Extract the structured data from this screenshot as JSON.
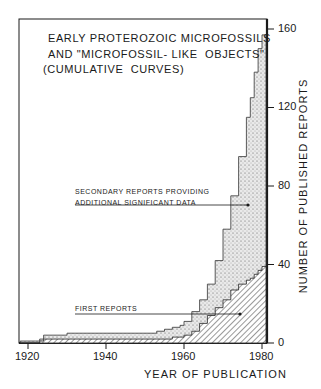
{
  "chart_data": {
    "type": "area",
    "title_lines": [
      "EARLY PROTEROZOIC MICROFOSSILS",
      "AND \"MICROFOSSIL- LIKE  OBJECTS\"",
      "(CUMULATIVE  CURVES)"
    ],
    "xlabel": "YEAR OF PUBLICATION",
    "ylabel": "NUMBER OF PUBLISHED REPORTS",
    "xlim": [
      1918,
      1981
    ],
    "ylim": [
      0,
      165
    ],
    "x_ticks": [
      1920,
      1940,
      1960,
      1980
    ],
    "y_ticks": [
      0,
      40,
      80,
      120,
      160
    ],
    "grid": false,
    "y_axis_position": "right",
    "x": [
      1918,
      1922,
      1923,
      1924,
      1930,
      1940,
      1950,
      1953,
      1955,
      1957,
      1959,
      1960,
      1962,
      1964,
      1966,
      1968,
      1970,
      1972,
      1974,
      1976,
      1977,
      1978,
      1979,
      1980
    ],
    "series": [
      {
        "name": "Secondary reports providing additional significant data (total cumulative)",
        "fill": "stippled",
        "values": [
          1,
          1,
          2,
          4,
          5,
          5,
          5,
          6,
          7,
          8,
          9,
          11,
          16,
          22,
          30,
          42,
          58,
          75,
          95,
          115,
          125,
          138,
          150,
          157
        ]
      },
      {
        "name": "First reports",
        "fill": "hatched",
        "values": [
          0,
          0,
          1,
          2,
          2,
          2,
          2,
          2,
          2,
          3,
          3,
          4,
          6,
          10,
          14,
          18,
          22,
          27,
          30,
          32,
          33,
          35,
          37,
          39
        ]
      }
    ],
    "annotations": [
      {
        "text": "SECONDARY REPORTS PROVIDING ADDITIONAL SIGNIFICANT DATA",
        "points_to": {
          "x": 1976,
          "y": 72
        }
      },
      {
        "text": "FIRST REPORTS",
        "points_to": {
          "x": 1975,
          "y": 15
        }
      }
    ]
  },
  "labels": {
    "title_line1": "EARLY PROTEROZOIC MICROFOSSILS",
    "title_line2": "AND \"MICROFOSSIL- LIKE  OBJECTS\"",
    "title_line3": "(CUMULATIVE  CURVES)",
    "secondary_line1": "SECONDARY REPORTS PROVIDING",
    "secondary_line2": "ADDITIONAL SIGNIFICANT DATA",
    "first_reports": "FIRST REPORTS",
    "xlabel": "YEAR OF PUBLICATION",
    "ylabel": "NUMBER OF PUBLISHED REPORTS",
    "xticks": [
      "1920",
      "1940",
      "1960",
      "1980"
    ],
    "yticks": [
      "160",
      "120",
      "80",
      "40",
      "0"
    ]
  }
}
